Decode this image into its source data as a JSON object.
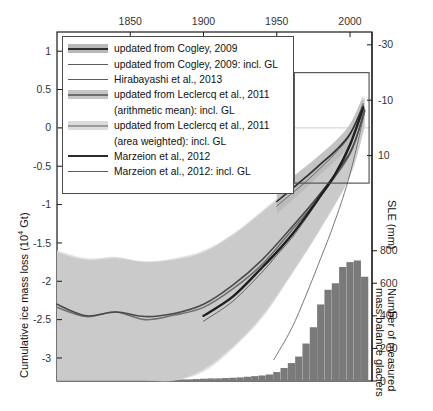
{
  "chart_data": {
    "type": "line",
    "title": "",
    "xlabel": "",
    "ylabel": "Cumulative ice mass loss (10^4 Gt)",
    "xlim": [
      1800,
      2015
    ],
    "ylim": [
      -3.3,
      1.25
    ],
    "grid": false,
    "x_axis_position": "top",
    "x_ticks": [
      1850,
      1900,
      1950,
      2000
    ],
    "y_ticks": [
      1,
      0.5,
      0,
      -0.5,
      -1,
      -1.5,
      -2,
      -2.5,
      -3
    ],
    "y_tick_labels": [
      "1",
      "0.5",
      "0",
      "-0.5",
      "-1",
      "-1.5",
      "-2",
      "-2.5",
      "-3"
    ],
    "right_axis_1": {
      "label": "SLE (mm)",
      "ticks": [
        10,
        -10,
        -30,
        -50
      ],
      "tick_labels": [
        "10",
        "-10",
        "-30",
        "-50"
      ]
    },
    "right_axis_2": {
      "label": "Number of measured mass balance glaciers",
      "ticks": [
        0,
        200,
        400,
        600,
        800
      ],
      "tick_labels": [
        "0",
        "200",
        "400",
        "600",
        "800"
      ],
      "ylim": [
        0,
        900
      ]
    },
    "legend_position": "upper-left",
    "inset_box": {
      "x_range": [
        1962,
        2013
      ],
      "y_range": [
        -0.72,
        0.72
      ]
    },
    "series": [
      {
        "name": "updated from Cogley, 2009",
        "style": "line-with-band",
        "color": "#2f2f2f",
        "band_color": "#b9b9b9",
        "x": [
          1950,
          1960,
          1970,
          1980,
          1990,
          2000,
          2009
        ],
        "values": [
          -0.96,
          -0.8,
          -0.64,
          -0.47,
          -0.3,
          -0.08,
          0.28
        ],
        "band_lower": [
          -1.12,
          -0.95,
          -0.78,
          -0.6,
          -0.43,
          -0.21,
          0.14
        ],
        "band_upper": [
          -0.8,
          -0.65,
          -0.5,
          -0.34,
          -0.17,
          0.05,
          0.42
        ]
      },
      {
        "name": "updated from Cogley, 2009: incl. GL",
        "style": "thin-line",
        "color": "#5d5d5d",
        "x": [
          1950,
          1960,
          1970,
          1980,
          1990,
          2000,
          2009
        ],
        "values": [
          -1.02,
          -0.86,
          -0.7,
          -0.52,
          -0.33,
          -0.09,
          0.32
        ]
      },
      {
        "name": "Hirabayashi et al., 2013",
        "style": "thin-line",
        "color": "#6a6a6a",
        "x": [
          1948,
          1960,
          1970,
          1980,
          1990,
          2000,
          2010
        ],
        "values": [
          -3.02,
          -2.62,
          -2.18,
          -1.7,
          -1.2,
          -0.6,
          0.2
        ]
      },
      {
        "name": "updated from Leclercq et al., 2011 (arithmetic mean): incl. GL",
        "style": "line-with-band",
        "color": "#4a4a4a",
        "band_color": "#c6c6c6",
        "x": [
          1800,
          1820,
          1840,
          1860,
          1880,
          1900,
          1920,
          1940,
          1960,
          1980,
          2000,
          2010
        ],
        "values": [
          -2.3,
          -2.45,
          -2.4,
          -2.46,
          -2.42,
          -2.3,
          -2.05,
          -1.72,
          -1.3,
          -0.85,
          -0.32,
          0.22
        ],
        "band_lower": [
          -3.3,
          -3.35,
          -3.3,
          -3.35,
          -3.3,
          -3.15,
          -2.85,
          -2.45,
          -1.9,
          -1.3,
          -0.62,
          0.02
        ],
        "band_upper": [
          -1.62,
          -1.72,
          -1.7,
          -1.75,
          -1.72,
          -1.62,
          -1.4,
          -1.1,
          -0.78,
          -0.45,
          -0.05,
          0.4
        ]
      },
      {
        "name": "updated from Leclercq et al., 2011 (area weighted): incl. GL",
        "style": "line-with-band",
        "color": "#707070",
        "band_color": "#dcdcdc",
        "x": [
          1800,
          1820,
          1840,
          1860,
          1880,
          1900,
          1920,
          1940,
          1960,
          1980,
          2000,
          2010
        ],
        "values": [
          -2.34,
          -2.46,
          -2.4,
          -2.5,
          -2.44,
          -2.34,
          -2.1,
          -1.78,
          -1.34,
          -0.88,
          -0.34,
          0.24
        ],
        "band_lower": [
          -3.32,
          -3.36,
          -3.32,
          -3.36,
          -3.32,
          -3.18,
          -2.88,
          -2.48,
          -1.92,
          -1.32,
          -0.64,
          0.0
        ],
        "band_upper": [
          -1.6,
          -1.7,
          -1.68,
          -1.74,
          -1.7,
          -1.6,
          -1.38,
          -1.08,
          -0.76,
          -0.44,
          -0.04,
          0.42
        ]
      },
      {
        "name": "Marzeion et al., 2012",
        "style": "thick-line",
        "color": "#1f1f1f",
        "x": [
          1900,
          1920,
          1940,
          1950,
          1960,
          1970,
          1980,
          1990,
          2000,
          2009
        ],
        "values": [
          -2.45,
          -2.2,
          -1.82,
          -1.62,
          -1.4,
          -1.15,
          -0.88,
          -0.6,
          -0.22,
          0.26
        ]
      },
      {
        "name": "Marzeion et al., 2012: incl. GL",
        "style": "thin-line",
        "color": "#555555",
        "x": [
          1900,
          1920,
          1940,
          1950,
          1960,
          1970,
          1980,
          1990,
          2000,
          2009
        ],
        "values": [
          -2.52,
          -2.26,
          -1.88,
          -1.66,
          -1.44,
          -1.18,
          -0.9,
          -0.62,
          -0.24,
          0.3
        ]
      }
    ],
    "bars": {
      "name": "Number of measured mass balance glaciers",
      "color": "#7a7a7a",
      "decades": [
        1880,
        1885,
        1890,
        1895,
        1900,
        1905,
        1910,
        1915,
        1920,
        1925,
        1930,
        1935,
        1940,
        1945,
        1950,
        1955,
        1960,
        1965,
        1970,
        1975,
        1980,
        1985,
        1990,
        1995,
        2000,
        2005,
        2010
      ],
      "values": [
        8,
        10,
        10,
        12,
        14,
        16,
        16,
        18,
        20,
        22,
        26,
        30,
        34,
        40,
        55,
        80,
        110,
        150,
        230,
        330,
        470,
        560,
        600,
        700,
        730,
        740,
        640
      ]
    }
  },
  "legend": {
    "items": [
      {
        "key": "band-dark",
        "label": "updated from Cogley, 2009",
        "cont": null
      },
      {
        "key": "thin",
        "label": "updated from Cogley, 2009: incl. GL",
        "cont": null
      },
      {
        "key": "thin",
        "label": "Hirabayashi et al., 2013",
        "cont": null
      },
      {
        "key": "band-mid",
        "label": "updated from Leclercq et al., 2011",
        "cont": "(arithmetic mean): incl. GL"
      },
      {
        "key": "band-light",
        "label": "updated from Leclercq et al., 2011",
        "cont": "(area weighted): incl. GL"
      },
      {
        "key": "thick",
        "label": "Marzeion et al., 2012",
        "cont": null
      },
      {
        "key": "thin",
        "label": "Marzeion et al., 2012: incl. GL",
        "cont": null
      }
    ]
  },
  "colors": {
    "axis": "#1a1a1a",
    "bar": "#7a7a7a",
    "zero_line": "#cfcfcf",
    "band_dark": "#b9b9b9",
    "band_mid": "#c6c6c6",
    "band_light": "#dcdcdc"
  }
}
